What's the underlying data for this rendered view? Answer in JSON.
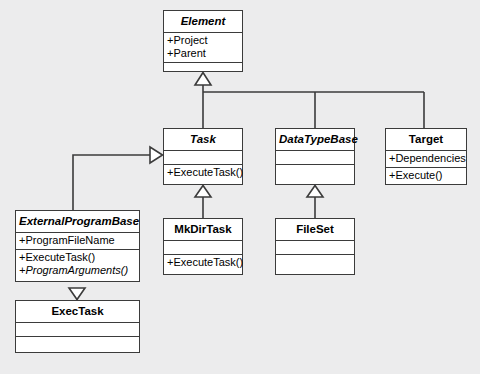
{
  "diagram": {
    "type": "uml-class-diagram",
    "background_color": "#ececed",
    "box_fill_color": "#ffffff",
    "line_color": "#3b3b3b"
  },
  "classes": {
    "element": {
      "name": "Element",
      "abstract": true,
      "attributes": [
        "+Project",
        "+Parent"
      ],
      "operations": []
    },
    "task": {
      "name": "Task",
      "abstract": true,
      "attributes": [],
      "operations": [
        "+ExecuteTask()"
      ]
    },
    "datatypebase": {
      "name": "DataTypeBase",
      "abstract": true,
      "attributes": [],
      "operations": []
    },
    "target": {
      "name": "Target",
      "abstract": false,
      "attributes": [
        "+Dependencies"
      ],
      "operations": [
        "+Execute()"
      ]
    },
    "externalprogrambase": {
      "name": "ExternalProgramBase",
      "abstract": true,
      "attributes": [
        "+ProgramFileName"
      ],
      "operations": [
        "+ExecuteTask()",
        "+ProgramArguments()"
      ]
    },
    "mkdirtask": {
      "name": "MkDirTask",
      "abstract": false,
      "attributes": [],
      "operations": [
        "+ExecuteTask()"
      ]
    },
    "fileset": {
      "name": "FileSet",
      "abstract": false,
      "attributes": [],
      "operations": []
    },
    "exectask": {
      "name": "ExecTask",
      "abstract": false,
      "attributes": [],
      "operations": []
    }
  },
  "relationships": [
    {
      "type": "generalization",
      "from": "Task",
      "to": "Element"
    },
    {
      "type": "generalization",
      "from": "DataTypeBase",
      "to": "Element"
    },
    {
      "type": "generalization",
      "from": "Target",
      "to": "Element"
    },
    {
      "type": "generalization",
      "from": "ExternalProgramBase",
      "to": "Task"
    },
    {
      "type": "generalization",
      "from": "MkDirTask",
      "to": "Task"
    },
    {
      "type": "generalization",
      "from": "FileSet",
      "to": "DataTypeBase"
    },
    {
      "type": "generalization",
      "from": "ExecTask",
      "to": "ExternalProgramBase"
    }
  ]
}
